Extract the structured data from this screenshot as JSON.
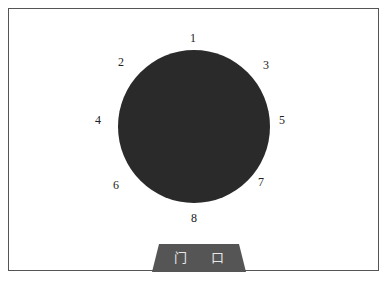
{
  "diagram": {
    "type": "seating-layout",
    "table": {
      "shape": "circle",
      "color": "#2a2a2a"
    },
    "seats": [
      {
        "label": "1",
        "x": 193,
        "y": 38
      },
      {
        "label": "2",
        "x": 121,
        "y": 62
      },
      {
        "label": "3",
        "x": 266,
        "y": 65
      },
      {
        "label": "4",
        "x": 98,
        "y": 120
      },
      {
        "label": "5",
        "x": 282,
        "y": 120
      },
      {
        "label": "6",
        "x": 116,
        "y": 185
      },
      {
        "label": "7",
        "x": 261,
        "y": 182
      },
      {
        "label": "8",
        "x": 194,
        "y": 218
      }
    ],
    "door": {
      "label": "门 口",
      "color": "#555555"
    }
  }
}
